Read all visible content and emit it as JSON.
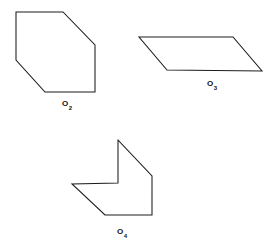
{
  "figure": {
    "background_color": "#ffffff",
    "stroke_color": "#1c1c1c",
    "label_color": "#111111",
    "width": 278,
    "height": 249,
    "shapes": [
      {
        "id": "shape-hexagon",
        "name": "hexagon-o2",
        "label_base": "O",
        "label_sub": "2",
        "label_text": "O2",
        "vertex_count": 6,
        "points": "16,12 63,12 95,45 95,92 45,92 16,60",
        "label_x": 67,
        "label_y": 105
      },
      {
        "id": "shape-parallelogram",
        "name": "parallelogram-o3",
        "label_base": "O",
        "label_sub": "3",
        "label_text": "O3",
        "vertex_count": 4,
        "points": "139,37 233,37 262,71 167,70",
        "label_x": 212,
        "label_y": 85
      },
      {
        "id": "shape-arrow",
        "name": "concave-arrow-o4",
        "label_base": "O",
        "label_sub": "4",
        "label_text": "O4",
        "vertex_count": 7,
        "points": "118,140 152,176 152,215 105,215 72,184 118,183 118,140",
        "label_x": 122,
        "label_y": 233
      }
    ]
  }
}
